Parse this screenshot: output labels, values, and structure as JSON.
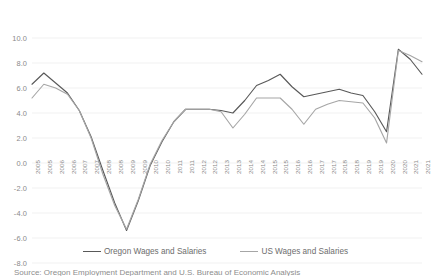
{
  "chart_data": {
    "type": "line",
    "title": "",
    "xlabel": "",
    "ylabel": "",
    "ylim": [
      -8.0,
      10.0
    ],
    "ytick_step": 2.0,
    "grid": true,
    "legend_position": "bottom",
    "ytick_labels": [
      "10.0",
      "8.0",
      "6.0",
      "4.0",
      "2.0",
      "0.0",
      "-2.0",
      "-4.0",
      "-6.0",
      "-8.0"
    ],
    "ytick_values": [
      10.0,
      8.0,
      6.0,
      4.0,
      2.0,
      0.0,
      -2.0,
      -4.0,
      -6.0,
      -8.0
    ],
    "categories": [
      "2005",
      "2005",
      "2006",
      "2006",
      "2007",
      "2007",
      "2008",
      "2008",
      "2009",
      "2009",
      "2010",
      "2010",
      "2011",
      "2011",
      "2012",
      "2012",
      "2013",
      "2013",
      "2014",
      "2014",
      "2015",
      "2015",
      "2016",
      "2016",
      "2017",
      "2017",
      "2018",
      "2018",
      "2019",
      "2019",
      "2020",
      "2020",
      "2021",
      "2021"
    ],
    "series": [
      {
        "name": "Oregon Wages and Salaries",
        "color": "#595959",
        "values": [
          6.3,
          7.2,
          6.4,
          5.6,
          4.2,
          2.1,
          -0.6,
          -3.2,
          -5.4,
          -3.0,
          -0.2,
          1.7,
          3.3,
          4.3,
          4.3,
          4.3,
          4.2,
          4.0,
          5.0,
          6.2,
          6.6,
          7.1,
          6.1,
          5.3,
          5.5,
          5.7,
          5.9,
          5.6,
          5.4,
          4.1,
          2.5,
          9.1,
          8.3,
          7.1
        ]
      },
      {
        "name": "US Wages and Salaries",
        "color": "#a6a6a6",
        "values": [
          5.2,
          6.3,
          6.0,
          5.5,
          4.2,
          2.0,
          -0.9,
          -3.4,
          -5.3,
          -2.9,
          -0.1,
          1.8,
          3.3,
          4.3,
          4.3,
          4.3,
          4.1,
          2.8,
          3.9,
          5.2,
          5.2,
          5.2,
          4.3,
          3.1,
          4.3,
          4.7,
          5.0,
          4.9,
          4.8,
          3.6,
          1.6,
          9.0,
          8.6,
          8.1
        ]
      }
    ]
  },
  "legend": {
    "entries": [
      {
        "label": "Oregon Wages and Salaries",
        "color": "#595959"
      },
      {
        "label": "US Wages and Salaries",
        "color": "#a6a6a6"
      }
    ]
  },
  "caption": {
    "text": "Source: Oregon Employment Department and U.S. Bureau of Economic Analysis"
  }
}
